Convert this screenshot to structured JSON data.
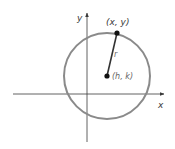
{
  "diagram": {
    "title": "",
    "axes": {
      "x_label": "x",
      "y_label": "y",
      "color": "#3a3a3a"
    },
    "circle": {
      "stroke": "#8a8a8a",
      "center_label": "(h, k)",
      "point_label": "(x, y)",
      "radius_label": "r"
    },
    "colors": {
      "point": "#111111",
      "radius_line": "#333333",
      "center_label": "#666666"
    }
  }
}
